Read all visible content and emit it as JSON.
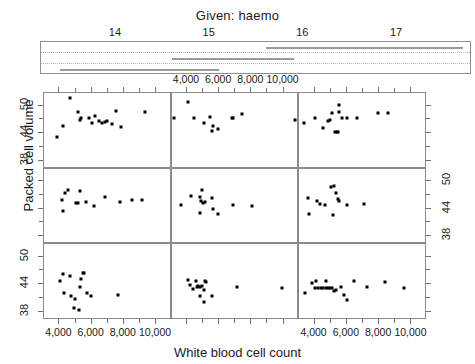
{
  "chart_data": {
    "type": "scatter",
    "plot_kind": "coplot",
    "title": "Given: haemo",
    "xlabel": "White blood cell count",
    "ylabel": "Packed cell volume",
    "conditioning_variable": "haemo",
    "conditioning_axis": {
      "ticks": [
        14,
        15,
        16,
        17
      ],
      "tick_labels": [
        "14",
        "15",
        "16",
        "17"
      ],
      "range": [
        13.2,
        17.8
      ],
      "gridlines": true,
      "gridline_count": 2
    },
    "conditioning_intervals": [
      {
        "panel": 1,
        "row": 3,
        "min": 13.4,
        "max": 14.9
      },
      {
        "panel": 2,
        "row": 3,
        "min": 14.3,
        "max": 15.1
      },
      {
        "panel": 3,
        "row": 2,
        "min": 14.6,
        "max": 15.4
      },
      {
        "panel": 4,
        "row": 2,
        "min": 15.0,
        "max": 15.9
      },
      {
        "panel": 5,
        "row": 1,
        "min": 15.6,
        "max": 16.5
      },
      {
        "panel": 6,
        "row": 1,
        "min": 16.0,
        "max": 17.7
      }
    ],
    "xlim": [
      3100,
      10900
    ],
    "ylim": [
      36.5,
      52.5
    ],
    "xticks": [
      4000,
      6000,
      8000,
      10000
    ],
    "xtick_labels": [
      "4,000",
      "6,000",
      "8,000",
      "10,000"
    ],
    "yticks": [
      38,
      44,
      50
    ],
    "ytick_labels": [
      "38",
      "44",
      "50"
    ],
    "grid": false,
    "legend": "none",
    "panel_rows": 3,
    "panel_cols": 3,
    "panel_order": "bottom-left-to-top-right",
    "axis_label_placement": {
      "x_top": "middle panel of top row",
      "x_bottom": "left and right panels of bottom row",
      "y_left": "top and bottom rows",
      "y_right": "middle row"
    },
    "panels": [
      {
        "index": 1,
        "grid_row": 3,
        "grid_col": 1,
        "points": [
          [
            4300,
            46.0
          ],
          [
            4100,
            44.5
          ],
          [
            4700,
            45.5
          ],
          [
            4350,
            42.0
          ],
          [
            4800,
            41.3
          ],
          [
            5050,
            40.6
          ],
          [
            4950,
            38.7
          ],
          [
            5250,
            38.2
          ],
          [
            5400,
            45.0
          ],
          [
            5500,
            46.2
          ],
          [
            5600,
            46.3
          ],
          [
            5350,
            43.1
          ],
          [
            5750,
            42.0
          ],
          [
            6050,
            41.3
          ],
          [
            7700,
            41.4
          ]
        ]
      },
      {
        "index": 2,
        "grid_row": 3,
        "grid_col": 2,
        "points": [
          [
            4150,
            44.8
          ],
          [
            4250,
            43.6
          ],
          [
            4450,
            42.7
          ],
          [
            4600,
            44.6
          ],
          [
            4700,
            43.3
          ],
          [
            4750,
            43.4
          ],
          [
            4850,
            43.3
          ],
          [
            4900,
            41.3
          ],
          [
            5000,
            43.4
          ],
          [
            5100,
            42.5
          ],
          [
            5200,
            44.5
          ],
          [
            5250,
            44.3
          ],
          [
            5150,
            39.9
          ],
          [
            5600,
            41.2
          ],
          [
            7200,
            43.2
          ],
          [
            9950,
            43.0
          ]
        ]
      },
      {
        "index": 3,
        "grid_row": 3,
        "grid_col": 3,
        "points": [
          [
            3450,
            41.8
          ],
          [
            3900,
            44.0
          ],
          [
            4100,
            43.0
          ],
          [
            4150,
            44.6
          ],
          [
            4300,
            42.9
          ],
          [
            4450,
            42.9
          ],
          [
            4600,
            42.9
          ],
          [
            4750,
            43.0
          ],
          [
            4800,
            44.5
          ],
          [
            4900,
            43.0
          ],
          [
            5000,
            43.0
          ],
          [
            5150,
            42.9
          ],
          [
            5250,
            42.4
          ],
          [
            5400,
            42.5
          ],
          [
            5700,
            43.3
          ],
          [
            5900,
            41.5
          ],
          [
            6050,
            40.4
          ],
          [
            6500,
            44.6
          ],
          [
            7300,
            43.3
          ],
          [
            8400,
            44.2
          ],
          [
            9600,
            43.0
          ]
        ]
      },
      {
        "index": 4,
        "grid_row": 2,
        "grid_col": 1,
        "points": [
          [
            4200,
            45.8
          ],
          [
            4400,
            47.2
          ],
          [
            4600,
            47.9
          ],
          [
            4300,
            43.3
          ],
          [
            5350,
            47.6
          ],
          [
            5100,
            45.0
          ],
          [
            5200,
            45.0
          ],
          [
            5700,
            45.3
          ],
          [
            6200,
            44.5
          ],
          [
            6900,
            46.4
          ],
          [
            7800,
            45.2
          ],
          [
            8600,
            45.7
          ],
          [
            9200,
            45.8
          ]
        ]
      },
      {
        "index": 5,
        "grid_row": 2,
        "grid_col": 2,
        "points": [
          [
            3700,
            44.6
          ],
          [
            4300,
            46.5
          ],
          [
            4850,
            46.4
          ],
          [
            5000,
            47.8
          ],
          [
            4950,
            45.4
          ],
          [
            5050,
            45.1
          ],
          [
            5200,
            45.2
          ],
          [
            4900,
            42.9
          ],
          [
            5600,
            46.2
          ],
          [
            5700,
            43.8
          ],
          [
            6000,
            42.6
          ],
          [
            6900,
            44.6
          ],
          [
            8100,
            44.5
          ]
        ]
      },
      {
        "index": 6,
        "grid_row": 2,
        "grid_col": 3,
        "points": [
          [
            3650,
            46.2
          ],
          [
            3700,
            42.6
          ],
          [
            4200,
            45.5
          ],
          [
            4400,
            44.8
          ],
          [
            4700,
            44.6
          ],
          [
            5100,
            48.6
          ],
          [
            5250,
            48.7
          ],
          [
            5400,
            47.3
          ],
          [
            5500,
            46.0
          ],
          [
            5550,
            45.4
          ],
          [
            5200,
            42.5
          ],
          [
            6100,
            44.7
          ],
          [
            7100,
            44.8
          ]
        ]
      },
      {
        "index": 7,
        "grid_row": 1,
        "grid_col": 1,
        "points": [
          [
            3900,
            43.0
          ],
          [
            4300,
            45.4
          ],
          [
            4700,
            51.5
          ],
          [
            5200,
            48.3
          ],
          [
            5400,
            47.0
          ],
          [
            5350,
            46.6
          ],
          [
            5900,
            47.1
          ],
          [
            6100,
            46.0
          ],
          [
            6250,
            47.6
          ],
          [
            6500,
            46.4
          ],
          [
            6700,
            46.1
          ],
          [
            6900,
            46.2
          ],
          [
            7000,
            46.4
          ],
          [
            7300,
            45.8
          ],
          [
            7600,
            48.7
          ],
          [
            7900,
            45.1
          ],
          [
            9400,
            48.4
          ]
        ]
      },
      {
        "index": 8,
        "grid_row": 1,
        "grid_col": 2,
        "points": [
          [
            3250,
            47.0
          ],
          [
            4100,
            50.5
          ],
          [
            4500,
            47.1
          ],
          [
            5150,
            46.0
          ],
          [
            5500,
            47.3
          ],
          [
            5650,
            45.3
          ],
          [
            5600,
            44.3
          ],
          [
            6000,
            44.8
          ],
          [
            6850,
            47.2
          ],
          [
            6950,
            47.2
          ],
          [
            7500,
            48.0
          ],
          [
            10750,
            46.7
          ]
        ]
      },
      {
        "index": 9,
        "grid_row": 1,
        "grid_col": 3,
        "points": [
          [
            3400,
            46.0
          ],
          [
            4100,
            47.1
          ],
          [
            4600,
            45.0
          ],
          [
            4900,
            46.5
          ],
          [
            5000,
            46.6
          ],
          [
            5150,
            48.1
          ],
          [
            5550,
            49.8
          ],
          [
            5600,
            48.5
          ],
          [
            5450,
            44.1
          ],
          [
            5500,
            44.0
          ],
          [
            5300,
            44.1
          ],
          [
            5750,
            47.2
          ],
          [
            6100,
            47.1
          ],
          [
            6700,
            47.0
          ],
          [
            8000,
            48.2
          ],
          [
            8600,
            48.2
          ]
        ]
      }
    ]
  },
  "axes": {
    "x_title": "White blood cell count",
    "y_title": "Packed cell volume",
    "x_tick_labels": [
      "4,000",
      "6,000",
      "8,000",
      "10,000"
    ],
    "y_tick_labels": [
      "38",
      "44",
      "50"
    ]
  },
  "given": {
    "title": "Given: haemo",
    "tick_labels": [
      "14",
      "15",
      "16",
      "17"
    ]
  },
  "colors": {
    "point": "#000000",
    "panel_border": "#8b8b8b",
    "strip_border": "#8e8e8e",
    "strip_bar": "#9a9a9a",
    "gridline": "#b9b9b9",
    "text": "#1a1a1a"
  }
}
